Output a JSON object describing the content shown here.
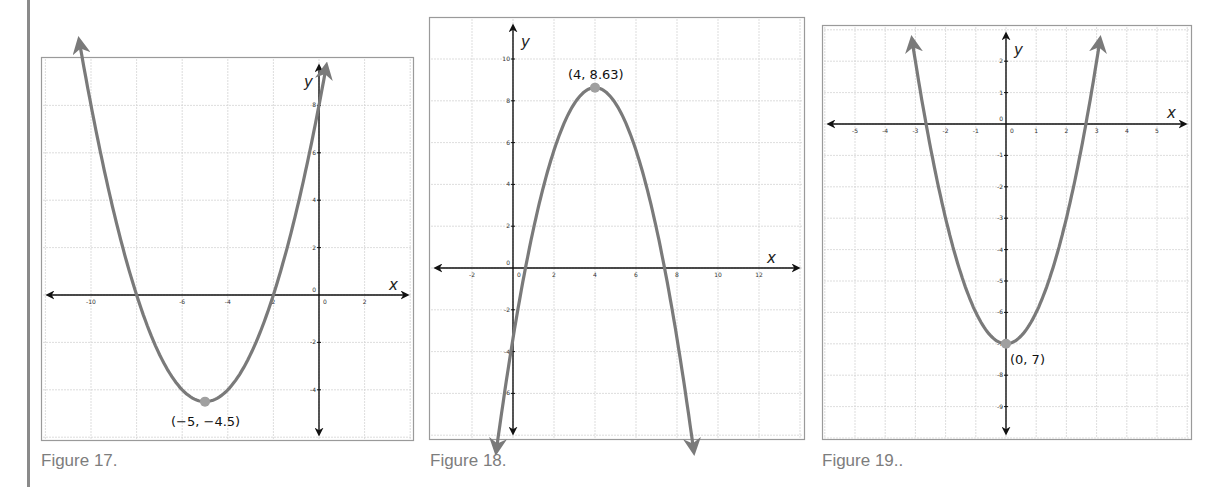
{
  "page": {
    "left_rule_color": "#8a8a8a",
    "curve_color": "#7a7a7a",
    "vertex_color": "#a0a0a0",
    "grid_color": "#d4d4d4",
    "frame_color": "#9a9a9a"
  },
  "figures": [
    {
      "id": "fig17",
      "caption": "Figure 17.",
      "vertex_label": "(−5, −4.5)",
      "x_axis_label": "x",
      "y_axis_label": "y"
    },
    {
      "id": "fig18",
      "caption": "Figure 18.",
      "vertex_label": "(4, 8.63)",
      "x_axis_label": "x",
      "y_axis_label": "y"
    },
    {
      "id": "fig19",
      "caption": "Figure 19..",
      "vertex_label": "(0, 7)",
      "x_axis_label": "x",
      "y_axis_label": "y"
    }
  ],
  "chart_data": [
    {
      "type": "line",
      "title": "Figure 17.",
      "xlabel": "x",
      "ylabel": "y",
      "xlim": [
        -12,
        4
      ],
      "ylim": [
        -6,
        10
      ],
      "x_ticks": [
        -10,
        -8,
        -6,
        -4,
        -2,
        0,
        2
      ],
      "x_tick_labels": [
        "-10",
        "",
        "-6",
        "-4",
        "2",
        "0",
        "2"
      ],
      "y_ticks": [
        8,
        6,
        4,
        2,
        0,
        -2,
        -4
      ],
      "grid": true,
      "series": [
        {
          "name": "parabola",
          "equation": "y = 0.5(x+5)^2 - 4.5",
          "x": [
            -10.5,
            -10,
            -9,
            -8,
            -7,
            -6,
            -5,
            -4,
            -3,
            -2,
            -1,
            0,
            0.3
          ],
          "y": [
            10.63,
            8,
            3.5,
            0,
            -2.5,
            -4,
            -4.5,
            -4,
            -2.5,
            0,
            3.5,
            8,
            9.55
          ]
        }
      ],
      "annotations": [
        {
          "text": "(−5, −4.5)",
          "x": -5,
          "y": -4.5,
          "marker": "vertex"
        }
      ],
      "arrows": "both ends"
    },
    {
      "type": "line",
      "title": "Figure 18.",
      "xlabel": "x",
      "ylabel": "y",
      "xlim": [
        -4,
        14
      ],
      "ylim": [
        -8,
        12
      ],
      "x_ticks": [
        -2,
        0,
        2,
        4,
        6,
        8,
        10,
        12
      ],
      "y_ticks": [
        10,
        8,
        6,
        4,
        2,
        0,
        -2,
        -4,
        -6
      ],
      "grid": true,
      "series": [
        {
          "name": "parabola",
          "equation": "y = -0.75(x-4)^2 + 8.63",
          "x": [
            -0.8,
            0,
            0.6,
            1,
            2,
            3,
            4,
            5,
            6,
            7,
            7.4,
            8,
            8.8
          ],
          "y": [
            -8.65,
            -3.37,
            0,
            1.88,
            5.63,
            7.88,
            8.63,
            7.88,
            5.63,
            1.88,
            0,
            -3.37,
            -8.65
          ]
        }
      ],
      "annotations": [
        {
          "text": "(4, 8.63)",
          "x": 4,
          "y": 8.63,
          "marker": "vertex"
        }
      ],
      "arrows": "both ends"
    },
    {
      "type": "line",
      "title": "Figure 19..",
      "xlabel": "x",
      "ylabel": "y",
      "xlim": [
        -6,
        6
      ],
      "ylim": [
        -10.5,
        3
      ],
      "x_ticks": [
        -5,
        -4,
        -3,
        -2,
        -1,
        0,
        1,
        2,
        3,
        4,
        5
      ],
      "y_ticks": [
        2,
        1,
        0,
        -1,
        -2,
        -3,
        -4,
        -5,
        -6,
        -7,
        -8,
        -9
      ],
      "grid": true,
      "series": [
        {
          "name": "parabola",
          "equation": "y = x^2 - 7",
          "x": [
            -3.1,
            -3,
            -2.65,
            -2,
            -1,
            0,
            1,
            2,
            2.65,
            3,
            3.1
          ],
          "y": [
            2.61,
            2,
            0,
            -3,
            -6,
            -7,
            -6,
            -3,
            0,
            2,
            2.61
          ]
        }
      ],
      "annotations": [
        {
          "text": "(0, 7)",
          "x": 0,
          "y": -7,
          "marker": "vertex"
        }
      ],
      "arrows": "both ends"
    }
  ]
}
